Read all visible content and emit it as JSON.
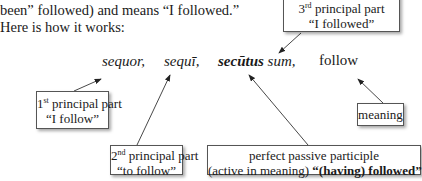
{
  "intro": {
    "line1": "been” followed) and means “I followed.”",
    "line2": "Here is how it works:"
  },
  "words": {
    "first": "sequor,",
    "second": "sequī,",
    "third_bold": "secūtus",
    "third_rest": "sum,",
    "meaning": "follow"
  },
  "boxes": {
    "third": {
      "ordinal_num": "3",
      "ordinal_sup": "rd",
      "title_rest": " principal part",
      "gloss": "“I followed”"
    },
    "first": {
      "ordinal_num": "1",
      "ordinal_sup": "st",
      "title_rest": " principal part",
      "gloss": "“I follow”"
    },
    "second": {
      "ordinal_num": "2",
      "ordinal_sup": "nd",
      "title_rest": " principal part",
      "gloss": "“to follow”"
    },
    "ppp": {
      "title": "perfect passive participle",
      "gloss_plain": "(active in meaning) ",
      "gloss_bold": "“(having) followed”"
    },
    "meaning": {
      "label": "meaning"
    }
  }
}
